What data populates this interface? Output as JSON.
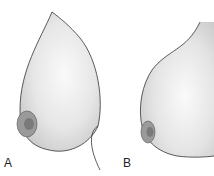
{
  "figure": {
    "panels": [
      {
        "label": "A",
        "description": "lateral view illustration, teardrop contour"
      },
      {
        "label": "B",
        "description": "lateral view illustration, fuller lower contour"
      }
    ],
    "colors": {
      "background": "#ffffff",
      "outline": "#333333",
      "fill_light": "#f2f2f2",
      "fill_shade": "#cfcfcf",
      "areola": "#8a8a8a"
    }
  }
}
